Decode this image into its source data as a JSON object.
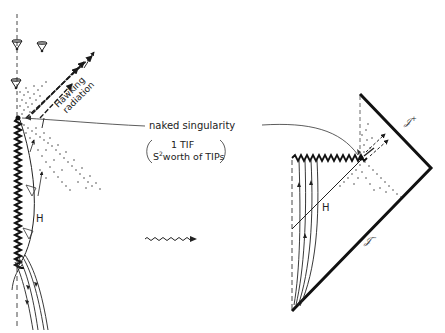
{
  "diagram": {
    "type": "penrose-carter spacetime diagrams (naked singularity formation and evaporation)",
    "colors": {
      "ink": "#1a1a1a",
      "background": "#ffffff",
      "faint": "#555555"
    },
    "labels": {
      "naked_singularity": "naked singularity",
      "tif_line1": "1 TIF",
      "tif_line2_prefix": "S",
      "tif_line2_sup": "2",
      "tif_line2_suffix": "worth of TIPs",
      "hawking_line1": "Hawking",
      "hawking_line2": "radiation",
      "horizon_left": "H",
      "horizon_right": "H",
      "scri_plus": "𝒥",
      "scri_plus_sup": "+",
      "scri_minus": "𝒥",
      "scri_minus_sup": "−"
    },
    "left_panel": {
      "description": "spacetime sketch of collapsing body forming black hole that evaporates to naked singularity",
      "light_cones": 5,
      "elements": [
        "dashed axis",
        "zigzag singularity",
        "horizon H",
        "Hawking radiation arrows",
        "dotted radiation region",
        "infalling worldlines"
      ]
    },
    "right_panel": {
      "description": "conformal (Penrose) diagram",
      "vertices": {
        "top": [
          360,
          94
        ],
        "right": [
          431,
          168
        ],
        "bottom": [
          292,
          311
        ]
      },
      "singularity_point": [
        361,
        158
      ],
      "elements": [
        "scri-plus boundary",
        "scri-minus boundary",
        "zigzag singularity",
        "horizon H",
        "dashed axis",
        "worldlines"
      ]
    },
    "transition_arrow": "wavy-arrow"
  }
}
